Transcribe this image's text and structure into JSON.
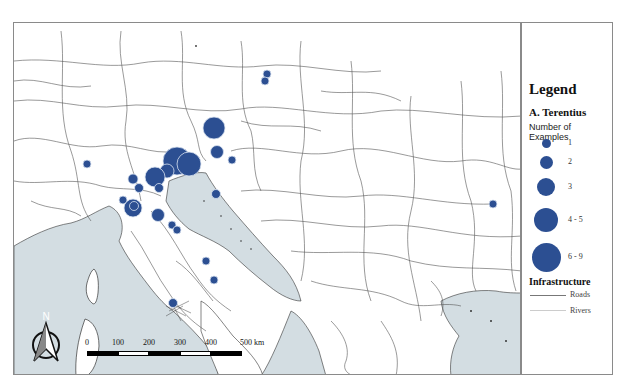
{
  "map": {
    "colors": {
      "sea": "#d3dde2",
      "land": "#ffffff",
      "road": "#555555",
      "river": "#bbbbbb",
      "site": "#2c4f92",
      "site_outline": "#d8e2f0"
    },
    "sites": [
      {
        "x": 266,
        "y": 73,
        "r": 4
      },
      {
        "x": 264,
        "y": 80,
        "r": 4
      },
      {
        "x": 213,
        "y": 127,
        "r": 11
      },
      {
        "x": 216,
        "y": 151,
        "r": 6.5
      },
      {
        "x": 231,
        "y": 159,
        "r": 4
      },
      {
        "x": 176,
        "y": 160,
        "r": 14
      },
      {
        "x": 188,
        "y": 163,
        "r": 12
      },
      {
        "x": 166,
        "y": 170,
        "r": 7
      },
      {
        "x": 154,
        "y": 176,
        "r": 10
      },
      {
        "x": 132,
        "y": 178,
        "r": 5
      },
      {
        "x": 158,
        "y": 187,
        "r": 4.5
      },
      {
        "x": 138,
        "y": 187,
        "r": 4.5
      },
      {
        "x": 86,
        "y": 163,
        "r": 4
      },
      {
        "x": 122,
        "y": 199,
        "r": 4
      },
      {
        "x": 132,
        "y": 207,
        "r": 9
      },
      {
        "x": 133,
        "y": 205,
        "r": 4.5
      },
      {
        "x": 157,
        "y": 214,
        "r": 6.5
      },
      {
        "x": 215,
        "y": 193,
        "r": 4.5
      },
      {
        "x": 171,
        "y": 224,
        "r": 4
      },
      {
        "x": 176,
        "y": 229,
        "r": 4
      },
      {
        "x": 205,
        "y": 260,
        "r": 4
      },
      {
        "x": 213,
        "y": 279,
        "r": 4
      },
      {
        "x": 172,
        "y": 302,
        "r": 4.5
      },
      {
        "x": 492,
        "y": 203,
        "r": 4
      }
    ]
  },
  "legend": {
    "title": "Legend",
    "layer": "A. Terentius",
    "subtitle": "Number of Examples",
    "classes": [
      {
        "label": "1",
        "r": 4.5,
        "y": 142
      },
      {
        "label": "2",
        "r": 6.5,
        "y": 161
      },
      {
        "label": "3",
        "r": 9,
        "y": 186
      },
      {
        "label": "4 - 5",
        "r": 12,
        "y": 219
      },
      {
        "label": "6 - 9",
        "r": 14.5,
        "y": 256
      }
    ],
    "infrastructure": {
      "title": "Infrastructure",
      "items": [
        {
          "label": "Roads",
          "type": "road"
        },
        {
          "label": "Rivers",
          "type": "river"
        }
      ]
    }
  },
  "scale_bar": {
    "labels": [
      "0",
      "100",
      "200",
      "300",
      "400",
      "500 km"
    ]
  },
  "compass": {
    "label": "N"
  }
}
